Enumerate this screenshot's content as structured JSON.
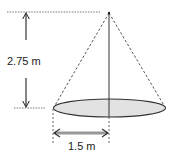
{
  "diagram": {
    "type": "cone-dimension",
    "height_label": "2.75 m",
    "radius_label": "1.5 m",
    "colors": {
      "stroke": "#333333",
      "dashed": "#555555",
      "base_fill": "#e2e2e2",
      "text": "#222222"
    }
  }
}
